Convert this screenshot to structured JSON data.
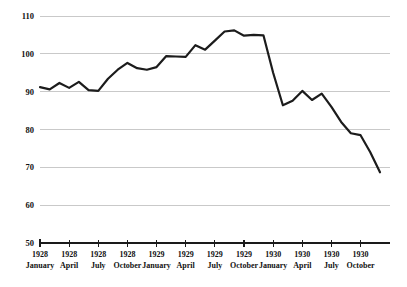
{
  "chart_data": {
    "type": "line",
    "title": "",
    "subtitle": "",
    "xlabel": "",
    "ylabel": "",
    "ylim": [
      50,
      110
    ],
    "yticks": [
      50,
      60,
      70,
      80,
      90,
      100,
      110
    ],
    "ytick_labels": [
      "50",
      "60",
      "70",
      "80",
      "90",
      "100",
      "110"
    ],
    "grid": true,
    "legend": "none",
    "xtick_labels": [
      {
        "year": "1928",
        "month": "January"
      },
      {
        "year": "1928",
        "month": "April"
      },
      {
        "year": "1928",
        "month": "July"
      },
      {
        "year": "1928",
        "month": "October"
      },
      {
        "year": "1929",
        "month": "January"
      },
      {
        "year": "1929",
        "month": "April"
      },
      {
        "year": "1929",
        "month": "July"
      },
      {
        "year": "1929",
        "month": "October"
      },
      {
        "year": "1930",
        "month": "January"
      },
      {
        "year": "1930",
        "month": "April"
      },
      {
        "year": "1930",
        "month": "July"
      },
      {
        "year": "1930",
        "month": "October"
      }
    ],
    "x": [
      "1928-01",
      "1928-02",
      "1928-03",
      "1928-04",
      "1928-05",
      "1928-06",
      "1928-07",
      "1928-08",
      "1928-09",
      "1928-10",
      "1928-11",
      "1928-12",
      "1929-01",
      "1929-02",
      "1929-03",
      "1929-04",
      "1929-05",
      "1929-06",
      "1929-07",
      "1929-08",
      "1929-09",
      "1929-10",
      "1929-11",
      "1929-12",
      "1930-01",
      "1930-02",
      "1930-03",
      "1930-04",
      "1930-05",
      "1930-06",
      "1930-07",
      "1930-08",
      "1930-09",
      "1930-10",
      "1930-11",
      "1930-12"
    ],
    "series": [
      {
        "name": "Index",
        "color": "#1c1c1c",
        "values": [
          91.2,
          90.6,
          92.3,
          91.0,
          92.6,
          90.4,
          90.2,
          93.4,
          95.8,
          97.6,
          96.2,
          95.8,
          96.5,
          99.4,
          99.3,
          99.2,
          102.3,
          101.1,
          103.5,
          105.9,
          106.2,
          104.8,
          105.0,
          104.9,
          95.0,
          86.4,
          87.6,
          90.2,
          87.8,
          89.5,
          86.0,
          82.0,
          79.0,
          78.5,
          74.0,
          68.7
        ]
      }
    ],
    "x_axis_range_months": 36,
    "point_count": 36
  },
  "colors": {
    "line": "#1c1c1c",
    "grid": "#c9c9c9",
    "axis": "#1a1a1a",
    "background": "#ffffff",
    "text": "#111111"
  }
}
